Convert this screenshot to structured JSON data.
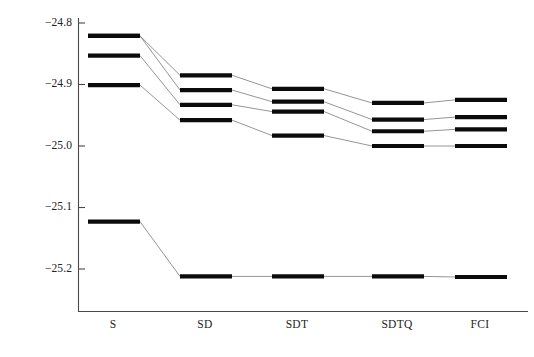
{
  "chart_data": {
    "type": "line",
    "title": "",
    "subtitle": "",
    "xlabel": "",
    "ylabel": "",
    "grid": false,
    "legend": "none",
    "categories": [
      "S",
      "SD",
      "SDT",
      "SDTQ",
      "FCI"
    ],
    "yticks": [
      "−24.8",
      "−24.9",
      "−25.0",
      "−25.1",
      "−25.2"
    ],
    "ytick_values": [
      -24.8,
      -24.9,
      -25.0,
      -25.1,
      -25.2
    ],
    "ylim": [
      -25.26,
      -24.78
    ],
    "annotations": [],
    "series": [
      {
        "name": "ground-state",
        "values": [
          -25.123,
          -25.212,
          -25.212,
          -25.212,
          -25.213
        ]
      },
      {
        "name": "excited-state-1",
        "values": [
          -24.821,
          -24.885,
          -24.907,
          -24.93,
          -24.925
        ]
      },
      {
        "name": "excited-state-2",
        "values": [
          -24.821,
          -24.909,
          -24.928,
          -24.957,
          -24.953
        ]
      },
      {
        "name": "excited-state-3",
        "values": [
          -24.853,
          -24.933,
          -24.944,
          -24.976,
          -24.973
        ]
      },
      {
        "name": "excited-state-4",
        "values": [
          -24.901,
          -24.958,
          -24.983,
          -25.0,
          -25.0
        ]
      }
    ]
  },
  "axes": {
    "x_axis_name": "excitation-level-axis",
    "y_axis_name": "energy-axis"
  }
}
